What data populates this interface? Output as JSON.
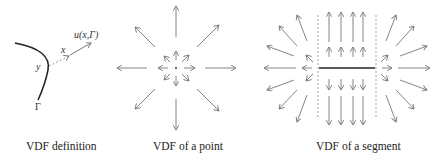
{
  "panels": [
    {
      "id": "definition",
      "caption": "VDF definition",
      "labels": {
        "curve": "Γ",
        "foot_point": "y",
        "query_point": "x",
        "vector": "u(x,Γ)"
      }
    },
    {
      "id": "point",
      "caption": "VDF of a point",
      "center": [
        176,
        68
      ]
    },
    {
      "id": "segment",
      "caption": "VDF of a segment",
      "segment": {
        "x1": 319,
        "x2": 375,
        "y": 68
      },
      "dashed_lines_x": [
        318,
        376
      ]
    }
  ],
  "colors": {
    "arrow": "#777777",
    "curve": "#222222",
    "dashed": "#999999",
    "text": "#222222"
  }
}
